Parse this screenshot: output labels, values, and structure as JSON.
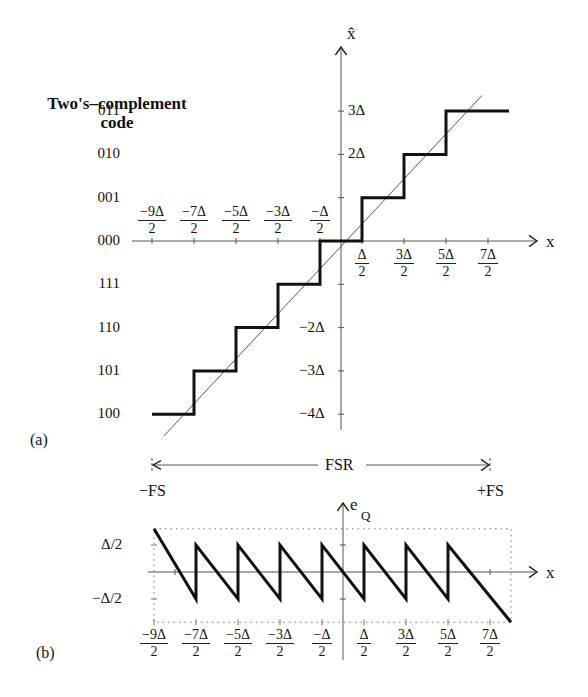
{
  "title": {
    "line1": "Two's–complement",
    "line2": "code"
  },
  "panel_a": {
    "label": "(a)",
    "y_axis_label": "x̂",
    "x_axis_label": "x",
    "codes": [
      "011",
      "010",
      "001",
      "000",
      "111",
      "110",
      "101",
      "100"
    ],
    "y_ticks": [
      {
        "level": 3,
        "label": "3Δ"
      },
      {
        "level": 2,
        "label": "2Δ"
      },
      {
        "level": -2,
        "label": "−2Δ"
      },
      {
        "level": -3,
        "label": "−3Δ"
      },
      {
        "level": -4,
        "label": "−4Δ"
      }
    ],
    "x_ticks_top": [
      {
        "at": -4.5,
        "num": "−9Δ",
        "den": "2"
      },
      {
        "at": -3.5,
        "num": "−7Δ",
        "den": "2"
      },
      {
        "at": -2.5,
        "num": "−5Δ",
        "den": "2"
      },
      {
        "at": -1.5,
        "num": "−3Δ",
        "den": "2"
      },
      {
        "at": -0.5,
        "num": "−Δ",
        "den": "2"
      }
    ],
    "x_ticks_bottom": [
      {
        "at": 0.5,
        "num": "Δ",
        "den": "2"
      },
      {
        "at": 1.5,
        "num": "3Δ",
        "den": "2"
      },
      {
        "at": 2.5,
        "num": "5Δ",
        "den": "2"
      },
      {
        "at": 3.5,
        "num": "7Δ",
        "den": "2"
      }
    ]
  },
  "fsr": {
    "label": "FSR",
    "minus": "−FS",
    "plus": "+FS"
  },
  "panel_b": {
    "label": "(b)",
    "y_axis_label": "e",
    "y_axis_sub": "Q",
    "x_axis_label": "x",
    "y_ticks": [
      {
        "value": 0.5,
        "label": "Δ/2"
      },
      {
        "value": -0.5,
        "label": "−Δ/2"
      }
    ],
    "x_ticks": [
      {
        "at": -4.5,
        "num": "−9Δ",
        "den": "2"
      },
      {
        "at": -3.5,
        "num": "−7Δ",
        "den": "2"
      },
      {
        "at": -2.5,
        "num": "−5Δ",
        "den": "2"
      },
      {
        "at": -1.5,
        "num": "−3Δ",
        "den": "2"
      },
      {
        "at": -0.5,
        "num": "−Δ",
        "den": "2"
      },
      {
        "at": 0.5,
        "num": "Δ",
        "den": "2"
      },
      {
        "at": 1.5,
        "num": "3Δ",
        "den": "2"
      },
      {
        "at": 2.5,
        "num": "5Δ",
        "den": "2"
      },
      {
        "at": 3.5,
        "num": "7Δ",
        "den": "2"
      }
    ]
  },
  "chart_data": [
    {
      "type": "line",
      "title": "(a) 3-bit mid-tread quantizer transfer characteristic",
      "xlabel": "x",
      "ylabel": "x̂ (two's-complement code)",
      "units": "Δ",
      "series": [
        {
          "name": "quantizer staircase",
          "x": [
            -4.5,
            -3.5,
            -3.5,
            -2.5,
            -2.5,
            -1.5,
            -1.5,
            -0.5,
            -0.5,
            0.5,
            0.5,
            1.5,
            1.5,
            2.5,
            2.5,
            4.0
          ],
          "y": [
            -4,
            -4,
            -3,
            -3,
            -2,
            -2,
            -1,
            -1,
            0,
            0,
            1,
            1,
            2,
            2,
            3,
            3
          ]
        },
        {
          "name": "ideal x̂ = x",
          "x": [
            -4.5,
            3.5
          ],
          "y": [
            -4.5,
            3.5
          ]
        }
      ],
      "code_map": {
        "3": "011",
        "2": "010",
        "1": "001",
        "0": "000",
        "-1": "111",
        "-2": "110",
        "-3": "101",
        "-4": "100"
      },
      "xlim": [
        -4.5,
        4.5
      ],
      "ylim": [
        -4.5,
        4.5
      ],
      "annotations": [
        "FSR spans −FS to +FS"
      ]
    },
    {
      "type": "line",
      "title": "(b) quantization error",
      "xlabel": "x",
      "ylabel": "e_Q",
      "units": "Δ",
      "series": [
        {
          "name": "e_Q",
          "x": [
            -4.5,
            -3.5,
            -3.5,
            -2.5,
            -2.5,
            -1.5,
            -1.5,
            -0.5,
            -0.5,
            0.5,
            0.5,
            1.5,
            1.5,
            2.5,
            2.5,
            4.0
          ],
          "y": [
            1.0,
            -0.5,
            0.5,
            -0.5,
            0.5,
            -0.5,
            0.5,
            -0.5,
            0.5,
            -0.5,
            0.5,
            -0.5,
            0.5,
            -0.5,
            0.5,
            -1.0
          ]
        }
      ],
      "ylim": [
        -1,
        1
      ],
      "grid": "dotted bounding box at ±Δ"
    }
  ]
}
